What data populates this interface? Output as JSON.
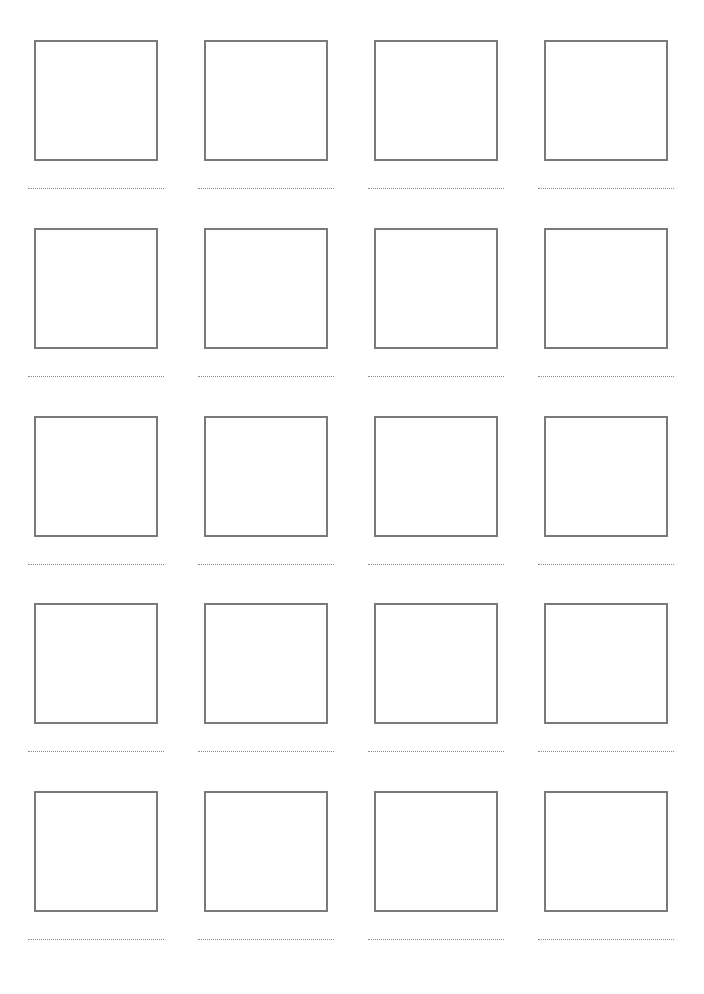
{
  "page": {
    "layout": "worksheet-grid",
    "columns": 4,
    "rows": 5,
    "colors": {
      "box_border": "#7a7a7a",
      "dotted_line": "#8c8c8c",
      "background": "#ffffff"
    }
  },
  "cells": [
    {
      "row": 0,
      "col": 0,
      "x": 28,
      "y": 40
    },
    {
      "row": 0,
      "col": 1,
      "x": 198,
      "y": 40
    },
    {
      "row": 0,
      "col": 2,
      "x": 368,
      "y": 40
    },
    {
      "row": 0,
      "col": 3,
      "x": 538,
      "y": 40
    },
    {
      "row": 1,
      "col": 0,
      "x": 28,
      "y": 228
    },
    {
      "row": 1,
      "col": 1,
      "x": 198,
      "y": 228
    },
    {
      "row": 1,
      "col": 2,
      "x": 368,
      "y": 228
    },
    {
      "row": 1,
      "col": 3,
      "x": 538,
      "y": 228
    },
    {
      "row": 2,
      "col": 0,
      "x": 28,
      "y": 416
    },
    {
      "row": 2,
      "col": 1,
      "x": 198,
      "y": 416
    },
    {
      "row": 2,
      "col": 2,
      "x": 368,
      "y": 416
    },
    {
      "row": 2,
      "col": 3,
      "x": 538,
      "y": 416
    },
    {
      "row": 3,
      "col": 0,
      "x": 28,
      "y": 603
    },
    {
      "row": 3,
      "col": 1,
      "x": 198,
      "y": 603
    },
    {
      "row": 3,
      "col": 2,
      "x": 368,
      "y": 603
    },
    {
      "row": 3,
      "col": 3,
      "x": 538,
      "y": 603
    },
    {
      "row": 4,
      "col": 0,
      "x": 28,
      "y": 791
    },
    {
      "row": 4,
      "col": 1,
      "x": 198,
      "y": 791
    },
    {
      "row": 4,
      "col": 2,
      "x": 368,
      "y": 791
    },
    {
      "row": 4,
      "col": 3,
      "x": 538,
      "y": 791
    }
  ]
}
